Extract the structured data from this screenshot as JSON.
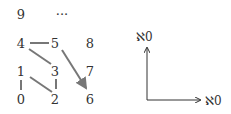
{
  "grid": {
    "nodes": [
      {
        "label": "9",
        "x": 15,
        "y": 8
      },
      {
        "label": "···",
        "x": 49,
        "y": 8
      },
      {
        "label": "4",
        "x": 15,
        "y": 37
      },
      {
        "label": "5",
        "x": 49,
        "y": 37
      },
      {
        "label": "8",
        "x": 84,
        "y": 37
      },
      {
        "label": "1",
        "x": 15,
        "y": 65
      },
      {
        "label": "3",
        "x": 49,
        "y": 65
      },
      {
        "label": "7",
        "x": 84,
        "y": 65
      },
      {
        "label": "0",
        "x": 15,
        "y": 93
      },
      {
        "label": "2",
        "x": 49,
        "y": 93
      },
      {
        "label": "6",
        "x": 84,
        "y": 93
      }
    ],
    "edges": [
      {
        "from": "4",
        "to": "5"
      },
      {
        "from": "4",
        "to": "3"
      },
      {
        "from": "1",
        "to": "0"
      },
      {
        "from": "1",
        "to": "2"
      },
      {
        "from": "3",
        "to": "2"
      },
      {
        "from": "5",
        "to": "6",
        "arrow": true
      }
    ]
  },
  "axes": {
    "y_label": "ℵ0",
    "x_label": "ℵ0"
  }
}
